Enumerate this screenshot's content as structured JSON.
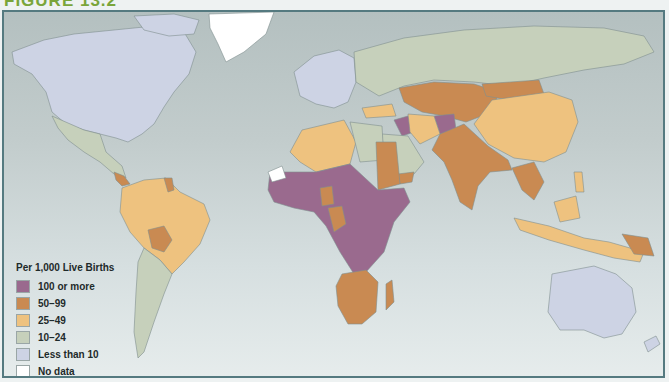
{
  "figure": {
    "title": "FIGURE 13.2"
  },
  "legend": {
    "title": "Per 1,000 Live Births",
    "items": [
      {
        "label": "100 or more",
        "color": "#9a6a8e"
      },
      {
        "label": "50–99",
        "color": "#c98a52"
      },
      {
        "label": "25–49",
        "color": "#eec27f"
      },
      {
        "label": "10–24",
        "color": "#c6d0bb"
      },
      {
        "label": "Less than 10",
        "color": "#cdd3e4"
      },
      {
        "label": "No data",
        "color": "#ffffff"
      }
    ]
  },
  "map": {
    "ocean_color": "#c4cfcf",
    "border_color": "#557a80",
    "regions": [
      {
        "name": "North America (USA/Canada)",
        "category": "Less than 10"
      },
      {
        "name": "Greenland",
        "category": "No data"
      },
      {
        "name": "Mexico & Central America",
        "category": "10–24"
      },
      {
        "name": "Brazil & Andean South America",
        "category": "25–49"
      },
      {
        "name": "Bolivia",
        "category": "50–99"
      },
      {
        "name": "Southern South America",
        "category": "10–24"
      },
      {
        "name": "Europe",
        "category": "Less than 10"
      },
      {
        "name": "Russia",
        "category": "10–24"
      },
      {
        "name": "Central Asia",
        "category": "50–99"
      },
      {
        "name": "China",
        "category": "25–49"
      },
      {
        "name": "South Asia",
        "category": "50–99"
      },
      {
        "name": "Afghanistan",
        "category": "100 or more"
      },
      {
        "name": "Middle East",
        "category": "10–24"
      },
      {
        "name": "North Africa",
        "category": "25–49"
      },
      {
        "name": "Sub-Saharan Africa",
        "category": "100 or more"
      },
      {
        "name": "Southern Africa",
        "category": "50–99"
      },
      {
        "name": "Southeast Asia",
        "category": "25–49"
      },
      {
        "name": "Australia & New Zealand",
        "category": "Less than 10"
      }
    ]
  }
}
